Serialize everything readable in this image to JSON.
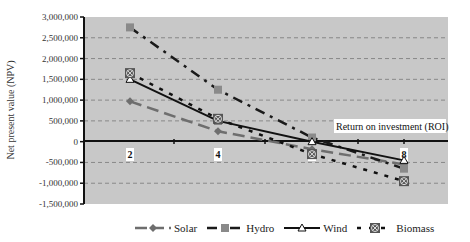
{
  "chart_data": {
    "type": "line",
    "title": "",
    "xlabel": "",
    "ylabel": "Net present value (NPV)",
    "x": [
      2,
      4,
      6,
      8
    ],
    "x_tick_labels": [
      "2",
      "4",
      "6",
      "8"
    ],
    "ylim": [
      -1500000,
      3000000
    ],
    "y_ticks": [
      3000000,
      2500000,
      2000000,
      1500000,
      1000000,
      500000,
      0,
      -500000,
      -1000000,
      -1500000
    ],
    "y_tick_labels": [
      "3,000,000",
      "2,500,000",
      "2,000,000",
      "1,500,000",
      "1,000,000",
      "500,000",
      "0",
      "-500,000",
      "-1,000,000",
      "-1,500,000"
    ],
    "grid": true,
    "legend_position": "bottom",
    "annotation": "Return on investment (ROI)",
    "series": [
      {
        "name": "Solar",
        "values": [
          970000,
          250000,
          -180000,
          -550000
        ],
        "color": "#6e6e6e",
        "style": "long-dash",
        "marker": "diamond"
      },
      {
        "name": "Hydro",
        "values": [
          2750000,
          1250000,
          100000,
          -650000
        ],
        "color": "#8a8a8a",
        "marker_color": "#8a8a8a",
        "line_color": "#1a1a1a",
        "style": "dash-dot",
        "marker": "square"
      },
      {
        "name": "Wind",
        "values": [
          1500000,
          500000,
          0,
          -450000
        ],
        "color": "#111111",
        "style": "solid",
        "marker": "triangle"
      },
      {
        "name": "Biomass",
        "values": [
          1650000,
          550000,
          -300000,
          -950000
        ],
        "color": "#111111",
        "style": "short-dash",
        "marker": "x-circle"
      }
    ]
  },
  "legend": {
    "items": [
      "Solar",
      "Hydro",
      "Wind",
      "Biomass"
    ]
  }
}
